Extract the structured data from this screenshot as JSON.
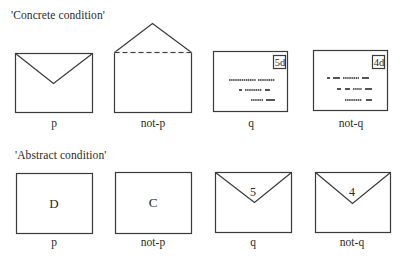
{
  "concrete": {
    "title": "'Concrete condition'",
    "cards": [
      {
        "id": "p",
        "label": "p",
        "type": "envelope-back-sealed"
      },
      {
        "id": "not-p",
        "label": "not-p",
        "type": "envelope-back-open"
      },
      {
        "id": "q",
        "label": "q",
        "type": "envelope-front-stamped",
        "stamp": "5d"
      },
      {
        "id": "not-q",
        "label": "not-q",
        "type": "envelope-front-stamped",
        "stamp": "4d"
      }
    ]
  },
  "abstract": {
    "title": "'Abstract condition'",
    "cards": [
      {
        "id": "p",
        "label": "p",
        "type": "card-letter",
        "text": "D"
      },
      {
        "id": "not-p",
        "label": "not-p",
        "type": "card-letter",
        "text": "C"
      },
      {
        "id": "q",
        "label": "q",
        "type": "envelope-back-number",
        "text": "5"
      },
      {
        "id": "not-q",
        "label": "not-q",
        "type": "envelope-back-number",
        "text": "4"
      }
    ]
  },
  "colors": {
    "stroke": "#3a3a3a",
    "text": "#2a2a2a",
    "background": "#ffffff"
  }
}
